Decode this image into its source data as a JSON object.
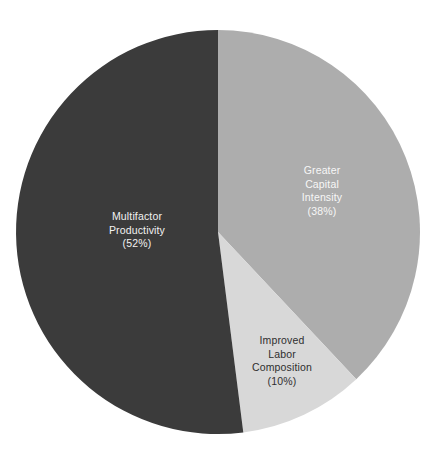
{
  "chart_data": {
    "type": "pie",
    "title": "",
    "subtitle": "",
    "xlabel": "",
    "ylabel": "",
    "legend_position": "none",
    "labels_inside_slices": true,
    "total_percent": 100,
    "categories": [
      "Greater Capital Intensity",
      "Improved Labor Composition",
      "Multifactor Productivity"
    ],
    "values": [
      38,
      10,
      52
    ],
    "slices": [
      {
        "name": "Greater Capital Intensity",
        "value": 38,
        "value_label": "(38%)",
        "color": "#adadad",
        "text_color": "#f7f7f7",
        "start_angle_deg": 0,
        "end_angle_deg": 136.8,
        "label_lines": [
          "Greater",
          "Capital",
          "Intensity"
        ]
      },
      {
        "name": "Improved Labor Composition",
        "value": 10,
        "value_label": "(10%)",
        "color": "#d8d8d8",
        "text_color": "#2e2e2e",
        "start_angle_deg": 136.8,
        "end_angle_deg": 172.8,
        "label_lines": [
          "Improved",
          "Labor",
          "Composition"
        ]
      },
      {
        "name": "Multifactor Productivity",
        "value": 52,
        "value_label": "(52%)",
        "color": "#3b3b3b",
        "text_color": "#f2f2f2",
        "start_angle_deg": 172.8,
        "end_angle_deg": 360,
        "label_lines": [
          "Multifactor",
          "Productivity"
        ]
      }
    ],
    "geometry": {
      "center_x": 218,
      "center_y": 232,
      "radius": 202,
      "start_at_twelve_oclock": true,
      "direction": "clockwise"
    },
    "background_color": "#ffffff"
  },
  "labels": {
    "multifactor": {
      "line1": "Multifactor",
      "line2": "Productivity",
      "value": "(52%)"
    },
    "capital": {
      "line1": "Greater",
      "line2": "Capital",
      "line3": "Intensity",
      "value": "(38%)"
    },
    "labor": {
      "line1": "Improved",
      "line2": "Labor",
      "line3": "Composition",
      "value": "(10%)"
    }
  }
}
